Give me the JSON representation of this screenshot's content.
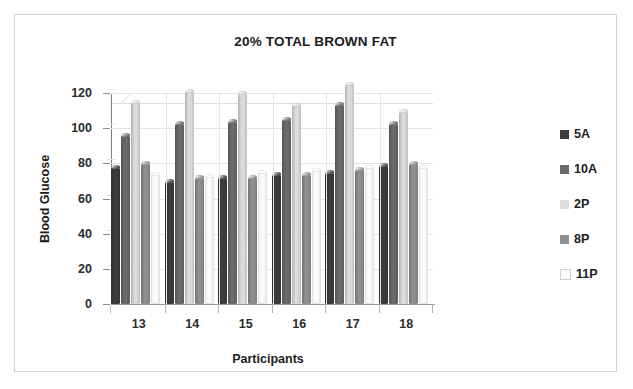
{
  "chart_data": {
    "type": "bar",
    "title": "20% TOTAL BROWN FAT",
    "xlabel": "Participants",
    "ylabel": "Blood Glucose",
    "categories": [
      "13",
      "14",
      "15",
      "16",
      "17",
      "18"
    ],
    "ylim": [
      0,
      120
    ],
    "yticks": [
      0,
      20,
      40,
      60,
      80,
      100,
      120
    ],
    "grid": true,
    "legend_position": "right",
    "style": "3d-cylinder-clustered",
    "series": [
      {
        "name": "5A",
        "color": "#3c3c3c",
        "values": [
          78,
          70,
          72,
          74,
          75,
          79
        ]
      },
      {
        "name": "10A",
        "color": "#6a6a6a",
        "values": [
          96,
          103,
          104,
          105,
          114,
          103
        ]
      },
      {
        "name": "2P",
        "color": "#dcdcdc",
        "values": [
          115,
          121,
          120,
          113,
          125,
          110
        ]
      },
      {
        "name": "8P",
        "color": "#8f8f8f",
        "values": [
          80,
          72,
          72,
          74,
          77,
          80
        ]
      },
      {
        "name": "11P",
        "color": "#fbfbfb",
        "values": [
          74,
          73,
          75,
          76,
          78,
          78
        ]
      }
    ]
  },
  "colors": {
    "title_text": "#1c1c1c",
    "axis_text": "#2b2b2b",
    "gridline": "#e3e3e3",
    "axis_line": "#7d7d7d",
    "frame_border": "#d2d2d2",
    "background": "#ffffff"
  }
}
